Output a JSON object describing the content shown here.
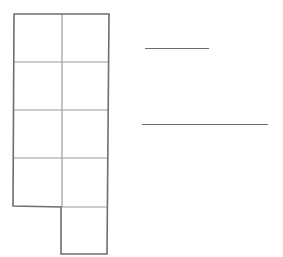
{
  "diagram": {
    "type": "grid-shape",
    "grid": {
      "columns": 2,
      "rows": 4,
      "extra_cells": [
        {
          "row": 4,
          "col": 1
        }
      ],
      "total_cells": 9
    },
    "colors": {
      "outline": "#6e6e6e",
      "inner_line": "#9a9a9a",
      "background": "#ffffff"
    }
  },
  "answer_lines": [
    {
      "name": "short-answer-line",
      "value": ""
    },
    {
      "name": "long-answer-line",
      "value": ""
    }
  ]
}
